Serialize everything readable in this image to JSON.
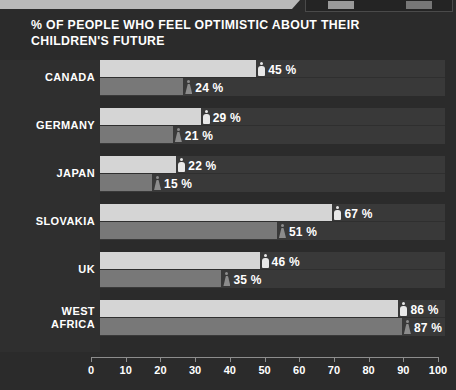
{
  "chart_data": {
    "type": "bar",
    "orientation": "horizontal",
    "title": "% OF PEOPLE WHO FEEL OPTIMISTIC ABOUT THEIR CHILDREN'S FUTURE",
    "xlabel": "",
    "ylabel": "",
    "xlim": [
      0,
      100
    ],
    "xticks": [
      "0",
      "10",
      "20",
      "30",
      "40",
      "50",
      "60",
      "70",
      "80",
      "90",
      "100"
    ],
    "grid": false,
    "legend_position": "none",
    "categories": [
      "CANADA",
      "GERMANY",
      "JAPAN",
      "SLOVAKIA",
      "UK",
      "WEST AFRICA"
    ],
    "series": [
      {
        "name": "male",
        "icon": "male-figure-icon",
        "color": "#d5d5d5",
        "values": [
          45,
          29,
          22,
          67,
          46,
          86
        ]
      },
      {
        "name": "female",
        "icon": "female-figure-icon",
        "color": "#787878",
        "values": [
          24,
          21,
          15,
          51,
          35,
          87
        ]
      }
    ],
    "value_labels": [
      [
        "45 %",
        "24 %"
      ],
      [
        "29 %",
        "21 %"
      ],
      [
        "22 %",
        "15 %"
      ],
      [
        "67 %",
        "51 %"
      ],
      [
        "46 %",
        "35 %"
      ],
      [
        "86 %",
        "87 %"
      ]
    ]
  },
  "groups": [
    {
      "label": "CANADA",
      "label_lines": [
        "CANADA"
      ],
      "male": 45,
      "female": 24,
      "male_label": "45 %",
      "female_label": "24 %"
    },
    {
      "label": "GERMANY",
      "label_lines": [
        "GERMANY"
      ],
      "male": 29,
      "female": 21,
      "male_label": "29 %",
      "female_label": "21 %"
    },
    {
      "label": "JAPAN",
      "label_lines": [
        "JAPAN"
      ],
      "male": 22,
      "female": 15,
      "male_label": "22 %",
      "female_label": "15 %"
    },
    {
      "label": "SLOVAKIA",
      "label_lines": [
        "SLOVAKIA"
      ],
      "male": 67,
      "female": 51,
      "male_label": "67 %",
      "female_label": "51 %"
    },
    {
      "label": "UK",
      "label_lines": [
        "UK"
      ],
      "male": 46,
      "female": 35,
      "male_label": "46 %",
      "female_label": "35 %"
    },
    {
      "label": "WEST AFRICA",
      "label_lines": [
        "WEST",
        "AFRICA"
      ],
      "male": 86,
      "female": 87,
      "male_label": "86 %",
      "female_label": "87 %"
    }
  ],
  "axis": {
    "ticks": [
      "0",
      "10",
      "20",
      "30",
      "40",
      "50",
      "60",
      "70",
      "80",
      "90",
      "100"
    ]
  },
  "colors": {
    "background": "#2b2b2b",
    "label_panel": "#2f2f2f",
    "track": "#393939",
    "male_bar": "#d5d5d5",
    "female_bar": "#787878",
    "text": "#ffffff",
    "axis": "#8d8d8d",
    "banner": "#b9b9b9"
  }
}
